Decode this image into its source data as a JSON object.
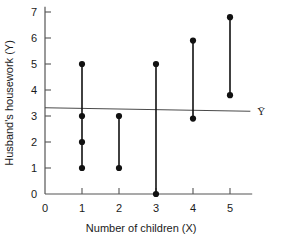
{
  "chart_data": {
    "type": "scatter",
    "title": "",
    "xlabel": "Number of children (X)",
    "ylabel": "Husband's housework (Y)",
    "xlim": [
      0,
      5.6
    ],
    "ylim": [
      0,
      7.2
    ],
    "xticks": [
      0,
      1,
      2,
      3,
      4,
      5
    ],
    "yticks": [
      0,
      1,
      2,
      3,
      4,
      5,
      6,
      7
    ],
    "xtick_labels": [
      "0",
      "1",
      "2",
      "3",
      "4",
      "5"
    ],
    "ytick_labels": [
      "0",
      "1",
      "2",
      "3",
      "4",
      "5",
      "6",
      "7"
    ],
    "grid": false,
    "legend": null,
    "points": [
      {
        "x": 1,
        "y": 5.0
      },
      {
        "x": 1,
        "y": 3.0
      },
      {
        "x": 1,
        "y": 2.0
      },
      {
        "x": 1,
        "y": 1.0
      },
      {
        "x": 2,
        "y": 3.0
      },
      {
        "x": 2,
        "y": 1.0
      },
      {
        "x": 3,
        "y": 5.0
      },
      {
        "x": 3,
        "y": 0.0
      },
      {
        "x": 4,
        "y": 5.9
      },
      {
        "x": 4,
        "y": 2.9
      },
      {
        "x": 5,
        "y": 6.8
      },
      {
        "x": 5,
        "y": 3.8
      }
    ],
    "connectors": [
      {
        "x": 1,
        "y_low": 1.0,
        "y_high": 5.0
      },
      {
        "x": 2,
        "y_low": 1.0,
        "y_high": 3.0
      },
      {
        "x": 3,
        "y_low": 0.0,
        "y_high": 5.0
      },
      {
        "x": 4,
        "y_low": 2.9,
        "y_high": 5.9
      },
      {
        "x": 5,
        "y_low": 3.8,
        "y_high": 6.8
      }
    ],
    "mean_line": {
      "label": "Ȳ",
      "y_left": 3.32,
      "y_right": 3.18,
      "x_start": 0.0,
      "x_end": 5.55
    },
    "colors": {
      "axis": "#555555",
      "data": "#111111",
      "mean_line": "#4a4a4a",
      "background": "#ffffff"
    }
  }
}
